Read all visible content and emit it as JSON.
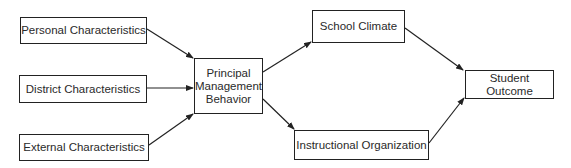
{
  "diagram": {
    "nodes": {
      "personal": {
        "label": "Personal Characteristics"
      },
      "district": {
        "label": "District Characteristics"
      },
      "external": {
        "label": "External Characteristics"
      },
      "principal": {
        "lines": [
          "Principal",
          "Management",
          "Behavior"
        ]
      },
      "climate": {
        "label": "School Climate"
      },
      "instruction": {
        "label": "Instructional Organization"
      },
      "outcome": {
        "label": "Student Outcome"
      }
    },
    "edges": [
      {
        "from": "Personal Characteristics",
        "to": "Principal Management Behavior"
      },
      {
        "from": "District Characteristics",
        "to": "Principal Management Behavior"
      },
      {
        "from": "External Characteristics",
        "to": "Principal Management Behavior"
      },
      {
        "from": "Principal Management Behavior",
        "to": "School Climate"
      },
      {
        "from": "Principal Management Behavior",
        "to": "Instructional Organization"
      },
      {
        "from": "School Climate",
        "to": "Student Outcome"
      },
      {
        "from": "Instructional Organization",
        "to": "Student Outcome"
      }
    ],
    "colors": {
      "stroke": "#222222",
      "background": "#ffffff"
    }
  }
}
